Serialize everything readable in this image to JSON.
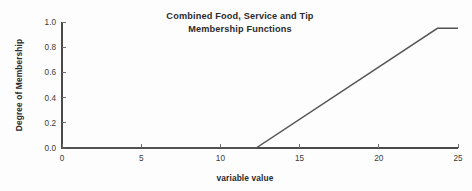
{
  "chart_data": {
    "type": "line",
    "title": "Combined Food, Service and Tip Membership Functions",
    "title_line1": "Combined Food, Service and Tip",
    "title_line2": "Membership Functions",
    "xlabel": "variable value",
    "ylabel": "Degree of Membership",
    "xlim": [
      0,
      25
    ],
    "ylim": [
      0.0,
      1.0
    ],
    "xticks": [
      0,
      5,
      10,
      15,
      20,
      25
    ],
    "xtick_labels": [
      "0",
      "5",
      "10",
      "15",
      "20",
      "25"
    ],
    "yticks": [
      0.0,
      0.2,
      0.4,
      0.6,
      0.8,
      1.0
    ],
    "ytick_labels": [
      "0.0",
      "0.2",
      "0.4",
      "0.6",
      "0.8",
      "1.0"
    ],
    "grid": false,
    "legend": false,
    "line_color": "#555555",
    "axis_color": "#4a4a4a",
    "background_color": "#fdfdfd",
    "series": [
      {
        "name": "Combined membership",
        "x": [
          0,
          12.25,
          23.7,
          25
        ],
        "values": [
          0.0,
          0.0,
          0.95,
          0.95
        ]
      }
    ],
    "annotations": []
  }
}
